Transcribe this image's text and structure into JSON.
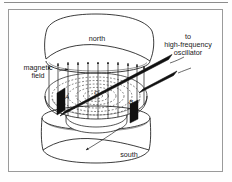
{
  "figure": {
    "type": "line-drawing",
    "labels": {
      "north": "north",
      "south": "south",
      "magnetic_field_line1": "magnetic",
      "magnetic_field_line2": "field",
      "oscillator_line1": "to",
      "oscillator_line2": "high-frequency",
      "oscillator_line3": "oscillator",
      "point_a": "A",
      "point_o": "O",
      "point_b": "B"
    },
    "colors": {
      "ink": "#1a1a1a",
      "frame": "#9a9a9a",
      "rule": "#8c8c8c",
      "paper": "#ffffff",
      "electrode_fill": "#111111"
    }
  }
}
